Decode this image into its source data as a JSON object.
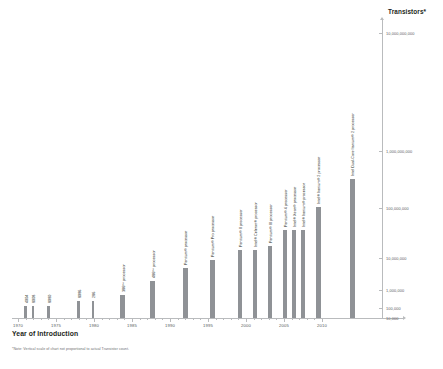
{
  "chart_data": {
    "type": "bar",
    "title": "",
    "xlabel": "Year of Introduction",
    "ylabel": "Transistors*",
    "footnote": "*Note: Vertical scale of chart not proportional to actual Transistor count.",
    "grid": false,
    "legend": "none",
    "xlim": [
      1970,
      2010
    ],
    "x_ticks": [
      1970,
      1975,
      1980,
      1985,
      1990,
      1995,
      2000,
      2005,
      2010
    ],
    "x_tick_labels": [
      "1970",
      "1975",
      "1980",
      "1985",
      "1990",
      "1995",
      "2000",
      "2005",
      "2010"
    ],
    "x_minor_tick_interval": 1,
    "y_tick_labels": [
      "10,000",
      "100,000",
      "1,000,000",
      "10,000,000",
      "100,000,000",
      "1,000,000,000",
      "10,000,000,000"
    ],
    "y_scale": "log (non-proportional spacing)",
    "bar_color": "#8f9296",
    "axis_color": "#b9bbbd",
    "categories": [
      "4004",
      "8008",
      "8080",
      "8086",
      "286",
      "386™ processor",
      "486™ processor",
      "Pentium® processor",
      "Pentium® Pro processor",
      "Pentium® II processor",
      "Intel® Celeron® processor",
      "Pentium® III processor",
      "Pentium® 4 processor",
      "Intel® Xeon® processor",
      "Intel® Itanium® processor",
      "Intel® Itanium® 2 processor",
      "Intel® Dual-Core Itanium® 2 processor"
    ],
    "x": [
      1971,
      1972,
      1974,
      1978,
      1982,
      1985,
      1989,
      1993,
      1995,
      1997,
      1998,
      1999,
      2000,
      2001,
      2002,
      2004,
      2006
    ],
    "values": [
      2300,
      3500,
      6000,
      29000,
      134000,
      275000,
      1200000,
      3100000,
      5500000,
      7500000,
      7500000,
      9500000,
      42000000,
      45000000,
      220000000,
      592000000,
      1720000000
    ],
    "bars": [
      {
        "label": "4004",
        "year": 1971,
        "x_px": 25.5,
        "height_px": 12,
        "label_x": 24.0,
        "label_bottom_px": 66
      },
      {
        "label": "8008",
        "year": 1972,
        "x_px": 33.0,
        "height_px": 12,
        "label_x": 31.5,
        "label_bottom_px": 66
      },
      {
        "label": "8080",
        "year": 1974,
        "x_px": 48.5,
        "height_px": 12,
        "label_x": 47.0,
        "label_bottom_px": 66
      },
      {
        "label": "8086",
        "year": 1978,
        "x_px": 78.5,
        "height_px": 17,
        "label_x": 77.0,
        "label_bottom_px": 71
      },
      {
        "label": "286",
        "year": 1982,
        "x_px": 93.0,
        "height_px": 17,
        "label_x": 91.5,
        "label_bottom_px": 71
      },
      {
        "label": "386™ processor",
        "year": 1985,
        "x_px": 122.5,
        "height_px": 23,
        "label_x": 121.0,
        "label_bottom_px": 77
      },
      {
        "label": "486™ processor",
        "year": 1989,
        "x_px": 152.5,
        "height_px": 37,
        "label_x": 151.0,
        "label_bottom_px": 91
      },
      {
        "label": "Pentium® processor",
        "year": 1993,
        "x_px": 185.0,
        "height_px": 50,
        "label_x": 183.5,
        "label_bottom_px": 104
      },
      {
        "label": "Pentium® Pro processor",
        "year": 1995,
        "x_px": 212.0,
        "height_px": 58,
        "label_x": 210.5,
        "label_bottom_px": 112
      },
      {
        "label": "Pentium® II processor",
        "year": 1997,
        "x_px": 240.0,
        "height_px": 68,
        "label_x": 238.5,
        "label_bottom_px": 122
      },
      {
        "label": "Intel® Celeron® processor",
        "year": 1998,
        "x_px": 255.0,
        "height_px": 68,
        "label_x": 253.5,
        "label_bottom_px": 122
      },
      {
        "label": "Pentium® III processor",
        "year": 1999,
        "x_px": 270.0,
        "height_px": 72,
        "label_x": 268.5,
        "label_bottom_px": 126
      },
      {
        "label": "Pentium® 4 processor",
        "year": 2000,
        "x_px": 285.0,
        "height_px": 88,
        "label_x": 283.5,
        "label_bottom_px": 142
      },
      {
        "label": "Intel® Xeon® processor",
        "year": 2001,
        "x_px": 294.0,
        "height_px": 88,
        "label_x": 292.5,
        "label_bottom_px": 142
      },
      {
        "label": "Intel® Itanium® processor",
        "year": 2002,
        "x_px": 303.0,
        "height_px": 88,
        "label_x": 301.5,
        "label_bottom_px": 142
      },
      {
        "label": "Intel® Itanium® 2 processor",
        "year": 2004,
        "x_px": 318.0,
        "height_px": 111,
        "label_x": 316.5,
        "label_bottom_px": 165
      },
      {
        "label": "Intel Dual-Core Itanium® 2 processor",
        "year": 2006,
        "x_px": 352.0,
        "height_px": 139,
        "label_x": 350.5,
        "label_bottom_px": 193
      }
    ],
    "y_ticks_px": [
      {
        "label": "10,000",
        "y_px": 318
      },
      {
        "label": "100,000",
        "y_px": 308
      },
      {
        "label": "1,000,000",
        "y_px": 290
      },
      {
        "label": "10,000,000",
        "y_px": 258
      },
      {
        "label": "100,000,000",
        "y_px": 208
      },
      {
        "label": "1,000,000,000",
        "y_px": 151
      },
      {
        "label": "10,000,000,000",
        "y_px": 33
      }
    ]
  }
}
